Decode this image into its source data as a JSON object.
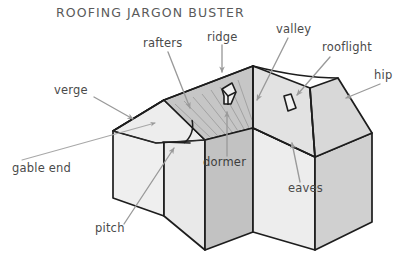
{
  "title": "ROOFING JARGON BUSTER",
  "diagram": {
    "shape": "L-shaped house with gable wing and hipped wing"
  },
  "labels": [
    {
      "key": "rafters",
      "text": "rafters",
      "x": 143,
      "y": 47,
      "anchor": "start"
    },
    {
      "key": "ridge",
      "text": "ridge",
      "x": 207,
      "y": 41,
      "anchor": "start"
    },
    {
      "key": "valley",
      "text": "valley",
      "x": 276,
      "y": 33,
      "anchor": "start"
    },
    {
      "key": "rooflight",
      "text": "rooflight",
      "x": 322,
      "y": 51,
      "anchor": "start"
    },
    {
      "key": "hip",
      "text": "hip",
      "x": 374,
      "y": 79,
      "anchor": "start"
    },
    {
      "key": "verge",
      "text": "verge",
      "x": 54,
      "y": 94,
      "anchor": "start"
    },
    {
      "key": "gable-end",
      "text": "gable end",
      "x": 12,
      "y": 172,
      "anchor": "start"
    },
    {
      "key": "dormer",
      "text": "dormer",
      "x": 203,
      "y": 166,
      "anchor": "start"
    },
    {
      "key": "eaves",
      "text": "eaves",
      "x": 288,
      "y": 192,
      "anchor": "start"
    },
    {
      "key": "pitch",
      "text": "pitch",
      "x": 95,
      "y": 232,
      "anchor": "start"
    }
  ],
  "colors": {
    "background": "#ffffff",
    "outline": "#1d1d1d",
    "leader": "#9a9a9a",
    "label_text": "#4a4a4a",
    "title_text": "#5a5a5a",
    "roof_front_left": "#ededed",
    "roof_rafter_plane": "#c6c6c6",
    "roof_right_front": "#e2e2e2",
    "roof_hip_end": "#d4d4d4",
    "wall_gable": "#efefef",
    "wall_dormer": "#c2c2c2",
    "wall_right_front": "#ededed",
    "wall_right_side": "#d0d0d0",
    "hatching": "#9c9c9c"
  },
  "features": {
    "dormer_window": "small pentagon dormer on left roof slope",
    "rooflight_window": "small rectangular rooflight on right roof slope",
    "pitch_angle": "arc marking the roof pitch angle at the gable"
  }
}
